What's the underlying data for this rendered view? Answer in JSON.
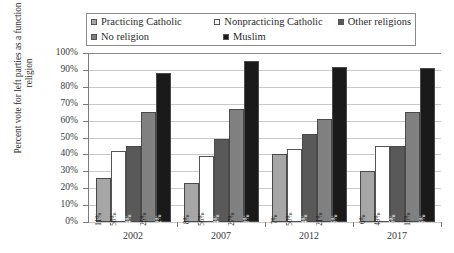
{
  "legend": {
    "items": [
      {
        "label": "Practicing Catholic",
        "color": "#a6a6a6",
        "key": "practicing_catholic"
      },
      {
        "label": "Nonpracticing Catholic",
        "color": "#ffffff",
        "key": "nonpracticing_catholic"
      },
      {
        "label": "Other religions",
        "color": "#595959",
        "key": "other_religions"
      },
      {
        "label": "No religion",
        "color": "#808080",
        "key": "no_religion"
      },
      {
        "label": "Muslim",
        "color": "#1a1a1a",
        "key": "muslim"
      }
    ]
  },
  "axes": {
    "y_title": "Percent vote for left parties as a function of religion",
    "y_ticks": [
      "100%",
      "90%",
      "80%",
      "70%",
      "60%",
      "50%",
      "40%",
      "30%",
      "20%",
      "10%",
      "0%"
    ],
    "x_ticks": [
      "2002",
      "2007",
      "2012",
      "2017"
    ]
  },
  "chart_data": {
    "type": "bar",
    "title": "",
    "subtitle": "",
    "xlabel": "",
    "ylabel": "Percent vote for left parties as a function of religion",
    "ylim": [
      0,
      100
    ],
    "ytick_values": [
      0,
      10,
      20,
      30,
      40,
      50,
      60,
      70,
      80,
      90,
      100
    ],
    "ytick_labels": [
      "0%",
      "10%",
      "20%",
      "30%",
      "40%",
      "50%",
      "60%",
      "70%",
      "80%",
      "90%",
      "100%"
    ],
    "grid": true,
    "legend_position": "top",
    "categories": [
      "2002",
      "2007",
      "2012",
      "2017"
    ],
    "series": [
      {
        "name": "Practicing Catholic",
        "color": "#a6a6a6",
        "values": [
          26,
          23,
          40,
          30
        ],
        "data_labels": [
          "11%",
          "8%",
          "7%",
          "6%"
        ]
      },
      {
        "name": "Nonpracticing Catholic",
        "color": "#ffffff",
        "values": [
          42,
          39,
          43,
          45
        ],
        "data_labels": [
          "58%",
          "56%",
          "50%",
          "49%"
        ]
      },
      {
        "name": "Other religions",
        "color": "#595959",
        "values": [
          45,
          49,
          52,
          45
        ],
        "data_labels": [
          "4%",
          "4%",
          "4%",
          "5%"
        ]
      },
      {
        "name": "No religion",
        "color": "#808080",
        "values": [
          65,
          67,
          61,
          65
        ],
        "data_labels": [
          "25%",
          "27%",
          "21%",
          "15%"
        ]
      },
      {
        "name": "Muslim",
        "color": "#1a1a1a",
        "values": [
          88,
          95,
          92,
          91
        ],
        "data_labels": [
          "2%",
          "3%",
          "5%",
          "5%"
        ]
      }
    ]
  }
}
